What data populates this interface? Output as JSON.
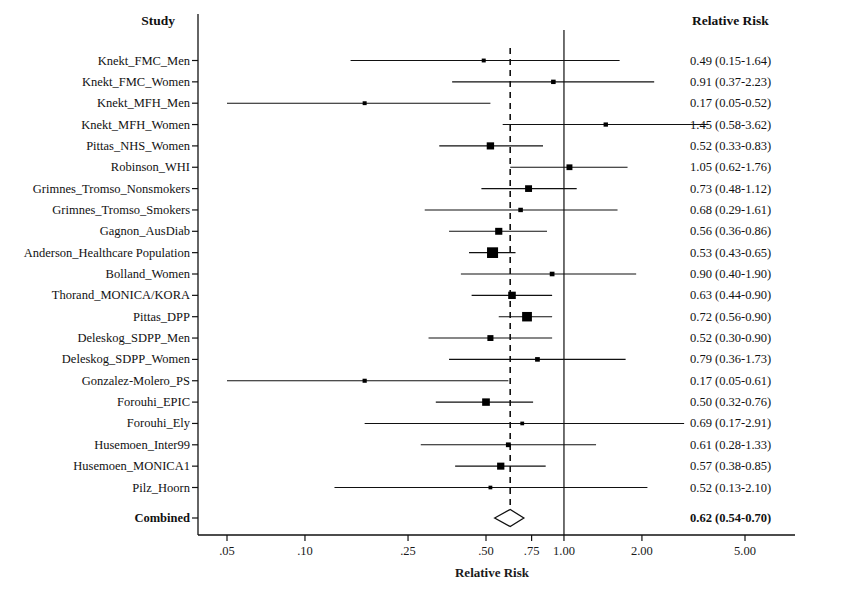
{
  "header": {
    "study_col": "Study",
    "rr_col": "Relative Risk"
  },
  "axis": {
    "title": "Relative Risk",
    "tick_labels": [
      ".05",
      ".10",
      ".25",
      ".50",
      ".75",
      "1.00",
      "2.00",
      "5.00"
    ],
    "tick_values": [
      0.05,
      0.1,
      0.25,
      0.5,
      0.75,
      1.0,
      2.0,
      5.0
    ],
    "scale": "log",
    "xlim": [
      0.043,
      6.1
    ],
    "null_line": 1.0,
    "pooled_line": 0.62
  },
  "combined": {
    "label": "Combined",
    "rr_text": "0.62 (0.54-0.70)",
    "rr": 0.62,
    "lcl": 0.54,
    "ucl": 0.7
  },
  "colors": {
    "ink": "#111111",
    "axis": "#222222",
    "marker": "#000000"
  },
  "chart_data": {
    "type": "forest",
    "title": "",
    "xlabel": "Relative Risk",
    "ylabel": "Study",
    "scale": "log",
    "xlim": [
      0.043,
      6.1
    ],
    "xticks": [
      0.05,
      0.1,
      0.25,
      0.5,
      0.75,
      1.0,
      2.0,
      5.0
    ],
    "xticklabels": [
      ".05",
      ".10",
      ".25",
      ".50",
      ".75",
      "1.00",
      "2.00",
      "5.00"
    ],
    "reference_line": 1.0,
    "pooled_line": 0.62,
    "grid": false,
    "legend": "none",
    "columns": [
      "Study",
      "Relative Risk"
    ],
    "rows": [
      {
        "study": "Knekt_FMC_Men",
        "rr": 0.49,
        "lcl": 0.15,
        "ucl": 1.64,
        "weight": 1.0,
        "rr_text": "0.49 (0.15-1.64)"
      },
      {
        "study": "Knekt_FMC_Women",
        "rr": 0.91,
        "lcl": 0.37,
        "ucl": 2.23,
        "weight": 1.3,
        "rr_text": "0.91 (0.37-2.23)"
      },
      {
        "study": "Knekt_MFH_Men",
        "rr": 0.17,
        "lcl": 0.05,
        "ucl": 0.52,
        "weight": 1.0,
        "rr_text": "0.17 (0.05-0.52)"
      },
      {
        "study": "Knekt_MFH_Women",
        "rr": 1.45,
        "lcl": 0.58,
        "ucl": 3.62,
        "weight": 1.2,
        "rr_text": "1.45 (0.58-3.62)"
      },
      {
        "study": "Pittas_NHS_Women",
        "rr": 0.52,
        "lcl": 0.33,
        "ucl": 0.83,
        "weight": 3.4,
        "rr_text": "0.52 (0.33-0.83)"
      },
      {
        "study": "Robinson_WHI",
        "rr": 1.05,
        "lcl": 0.62,
        "ucl": 1.76,
        "weight": 2.2,
        "rr_text": "1.05 (0.62-1.76)"
      },
      {
        "study": "Grimnes_Tromso_Nonsmokers",
        "rr": 0.73,
        "lcl": 0.48,
        "ucl": 1.12,
        "weight": 3.0,
        "rr_text": "0.73 (0.48-1.12)"
      },
      {
        "study": "Grimnes_Tromso_Smokers",
        "rr": 0.68,
        "lcl": 0.29,
        "ucl": 1.61,
        "weight": 1.3,
        "rr_text": "0.68 (0.29-1.61)"
      },
      {
        "study": "Gagnon_AusDiab",
        "rr": 0.56,
        "lcl": 0.36,
        "ucl": 0.86,
        "weight": 3.2,
        "rr_text": "0.56 (0.36-0.86)"
      },
      {
        "study": "Anderson_Healthcare Population",
        "rr": 0.53,
        "lcl": 0.43,
        "ucl": 0.65,
        "weight": 7.6,
        "rr_text": "0.53 (0.43-0.65)"
      },
      {
        "study": "Bolland_Women",
        "rr": 0.9,
        "lcl": 0.4,
        "ucl": 1.9,
        "weight": 1.4,
        "rr_text": "0.90 (0.40-1.90)"
      },
      {
        "study": "Thorand_MONICA/KORA",
        "rr": 0.63,
        "lcl": 0.44,
        "ucl": 0.9,
        "weight": 3.6,
        "rr_text": "0.63 (0.44-0.90)"
      },
      {
        "study": "Pittas_DPP",
        "rr": 0.72,
        "lcl": 0.56,
        "ucl": 0.9,
        "weight": 6.0,
        "rr_text": "0.72 (0.56-0.90)"
      },
      {
        "study": "Deleskog_SDPP_Men",
        "rr": 0.52,
        "lcl": 0.3,
        "ucl": 0.9,
        "weight": 2.3,
        "rr_text": "0.52 (0.30-0.90)"
      },
      {
        "study": "Deleskog_SDPP_Women",
        "rr": 0.79,
        "lcl": 0.36,
        "ucl": 1.73,
        "weight": 1.4,
        "rr_text": "0.79 (0.36-1.73)"
      },
      {
        "study": "Gonzalez-Molero_PS",
        "rr": 0.17,
        "lcl": 0.05,
        "ucl": 0.61,
        "weight": 1.1,
        "rr_text": "0.17 (0.05-0.61)"
      },
      {
        "study": "Forouhi_EPIC",
        "rr": 0.5,
        "lcl": 0.32,
        "ucl": 0.76,
        "weight": 3.7,
        "rr_text": "0.50 (0.32-0.76)"
      },
      {
        "study": "Forouhi_Ely",
        "rr": 0.69,
        "lcl": 0.17,
        "ucl": 2.91,
        "weight": 0.9,
        "rr_text": "0.69 (0.17-2.91)"
      },
      {
        "study": "Husemoen_Inter99",
        "rr": 0.61,
        "lcl": 0.28,
        "ucl": 1.33,
        "weight": 1.5,
        "rr_text": "0.61 (0.28-1.33)"
      },
      {
        "study": "Husemoen_MONICA1",
        "rr": 0.57,
        "lcl": 0.38,
        "ucl": 0.85,
        "weight": 3.3,
        "rr_text": "0.57 (0.38-0.85)"
      },
      {
        "study": "Pilz_Hoorn",
        "rr": 0.52,
        "lcl": 0.13,
        "ucl": 2.1,
        "weight": 0.9,
        "rr_text": "0.52 (0.13-2.10)"
      }
    ]
  }
}
